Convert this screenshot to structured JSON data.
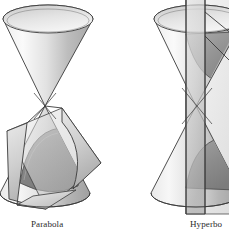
{
  "illustration": {
    "title": "Conic sections",
    "background_color": "#ffffff",
    "outline_color": "#3a3a3a",
    "figures": [
      {
        "id": "parabola-figure",
        "caption": "Parabola",
        "description": "Double cone intersected by a tilted plane parallel to a generating line, producing a parabola",
        "cone": {
          "apex": {
            "x": 45,
            "y": 106
          },
          "top_rim": {
            "cx": 48,
            "cy": 19,
            "rx": 45,
            "ry": 14
          },
          "bottom_rim": {
            "cx": 45,
            "cy": 193,
            "rx": 45,
            "ry": 14
          }
        },
        "cutting_plane": {
          "type": "tilted",
          "corners": [
            {
              "x": 7,
              "y": 131
            },
            {
              "x": 62,
              "y": 108
            },
            {
              "x": 101,
              "y": 163
            },
            {
              "x": 46,
              "y": 209
            }
          ]
        },
        "conic_curve": {
          "type": "parabola",
          "fill_color": "#8a8a8a"
        }
      },
      {
        "id": "hyperbola-figure",
        "caption": "Hyperbo",
        "caption_truncated": true,
        "description": "Double cone intersected by a vertical plane parallel to the axis, producing a hyperbola",
        "cone": {
          "apex": {
            "x": 196,
            "y": 106
          },
          "top_rim": {
            "cx": 199,
            "cy": 19,
            "rx": 45,
            "ry": 14
          },
          "bottom_rim": {
            "cx": 196,
            "cy": 193,
            "rx": 45,
            "ry": 14
          }
        },
        "cutting_plane": {
          "type": "vertical",
          "corners": [
            {
              "x": 186,
              "y": -10
            },
            {
              "x": 245,
              "y": -10
            },
            {
              "x": 245,
              "y": 214
            },
            {
              "x": 186,
              "y": 214
            }
          ]
        },
        "conic_curve": {
          "type": "hyperbola",
          "fill_color": "#8a8a8a"
        }
      }
    ],
    "palette": {
      "cone_light": "#f2f2f2",
      "cone_mid": "#d8d8d8",
      "cone_dark": "#a9a9a9",
      "cone_shadow": "#8a8a8a",
      "plane_light": "#e6e6e6",
      "plane_mid": "#c9c9c9",
      "plane_dark": "#9f9f9f",
      "outline": "#3a3a3a",
      "caption_text": "#2b2b2b"
    }
  }
}
